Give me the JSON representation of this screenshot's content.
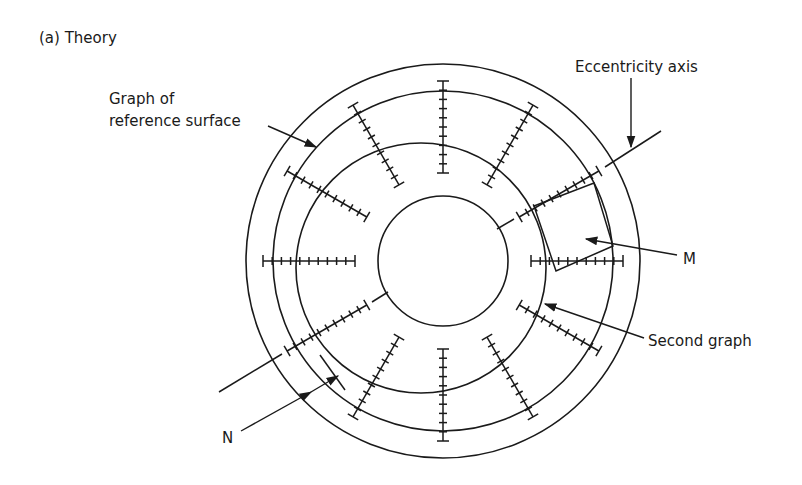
{
  "figure": {
    "title": "(a) Theory",
    "labels": {
      "reference_line1": "Graph of",
      "reference_line2": "reference surface",
      "eccentricity": "Eccentricity axis",
      "m": "M",
      "second_graph": "Second graph",
      "n": "N"
    },
    "geometry": {
      "center": [
        443,
        261
      ],
      "outer_radius": 197,
      "reference_radius": 170,
      "inner_radius": 65,
      "second_graph_center": [
        421,
        268
      ],
      "second_graph_radius": 125,
      "scale_count": 12,
      "scale_inner_r": 88,
      "scale_outer_r": 180,
      "ticks_per_scale": 10
    },
    "colors": {
      "stroke": "#1a1a1a",
      "background": "#ffffff"
    }
  }
}
